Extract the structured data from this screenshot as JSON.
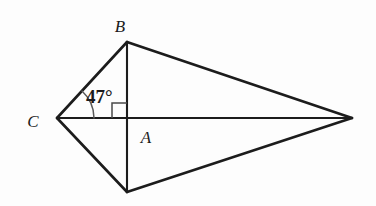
{
  "figure": {
    "background_color": "#fdfdfd",
    "stroke_color": "#1c1c1c",
    "marker_color": "#4a4a4a",
    "width": 376,
    "height": 206
  },
  "labels": {
    "vertex_b": "B",
    "vertex_c": "C",
    "vertex_a": "A",
    "angle_at_c": "47°"
  },
  "points": {
    "B": {
      "x": 127,
      "y": 42
    },
    "C": {
      "x": 57,
      "y": 118
    },
    "A": {
      "x": 127,
      "y": 118
    },
    "D": {
      "x": 127,
      "y": 192
    },
    "E": {
      "x": 352,
      "y": 118
    }
  },
  "label_positions": {
    "B": {
      "x": 120,
      "y": 32
    },
    "C": {
      "x": 29,
      "y": 127
    },
    "A": {
      "x": 139,
      "y": 143
    },
    "angle": {
      "x": 86,
      "y": 103
    }
  },
  "segments": [
    {
      "name": "C-B",
      "from": "C",
      "to": "B"
    },
    {
      "name": "B-E",
      "from": "B",
      "to": "E"
    },
    {
      "name": "C-D",
      "from": "C",
      "to": "D"
    },
    {
      "name": "D-E",
      "from": "D",
      "to": "E"
    },
    {
      "name": "C-E",
      "from": "C",
      "to": "E"
    },
    {
      "name": "B-D",
      "from": "B",
      "to": "D"
    }
  ],
  "markers": {
    "right_angle": {
      "name": "right-angle-at-A",
      "vertex": "A",
      "size": 15,
      "quadrant": "upper-left"
    },
    "angle_arc": {
      "name": "angle-arc-at-C",
      "vertex": "C",
      "measure_degrees": 47,
      "radius": 37
    }
  }
}
